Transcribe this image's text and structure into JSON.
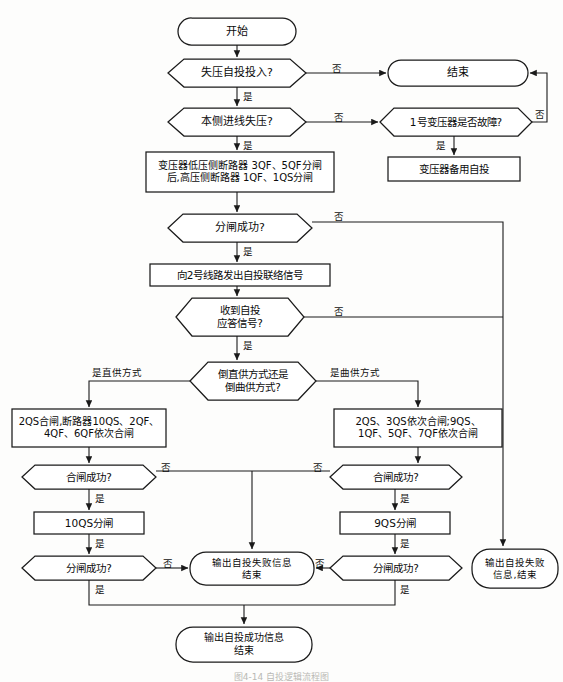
{
  "diagram": {
    "title_caption": "图4-14   自投逻辑流程图",
    "language": "zh-CN",
    "stroke_color": "#1a1a1a",
    "fill_color": "#ffffff",
    "background_color": "#fdfdfc",
    "yes_label": "是",
    "no_label": "否"
  },
  "nodes": {
    "start": {
      "label": "开始",
      "shape": "terminator"
    },
    "d_voltage_loss_enabled": {
      "label": "失压自投投入?",
      "shape": "decision"
    },
    "end_top": {
      "label": "结束",
      "shape": "terminator"
    },
    "d_local_line_loss": {
      "label": "本侧进线失压?",
      "shape": "decision"
    },
    "d_transformer_fault": {
      "label": "1号变压器是否故障?",
      "shape": "decision"
    },
    "transformer_standby": {
      "label": "变压器备用自投",
      "shape": "process"
    },
    "open_breakers": {
      "label_line1": "变压器低压侧断路器 3QF、5QF分闸",
      "label_line2": "后,高压侧断路器 1QF、1QS分闸",
      "shape": "process"
    },
    "d_open_success": {
      "label": "分闸成功?",
      "shape": "decision"
    },
    "send_signal": {
      "label": "向2号线路发出自投联络信号",
      "shape": "process"
    },
    "d_reply_signal": {
      "label_line1": "收到自投",
      "label_line2": "应答信号?",
      "shape": "decision"
    },
    "d_supply_mode": {
      "label_line1": "倒直供方式还是",
      "label_line2": "倒曲供方式?",
      "shape": "decision"
    },
    "left_close": {
      "label_line1": "2QS合闸,断路器10QS、2QF、",
      "label_line2": "4QF、6QF依次合闸",
      "shape": "process"
    },
    "right_close": {
      "label_line1": "2QS、3QS依次合闸;9QS、",
      "label_line2": "1QF、5QF、7QF依次合闸",
      "shape": "process"
    },
    "d_left_close_success": {
      "label": "合闸成功?",
      "shape": "decision"
    },
    "d_right_close_success": {
      "label": "合闸成功?",
      "shape": "decision"
    },
    "left_open_10qs": {
      "label": "10QS分闸",
      "shape": "process"
    },
    "right_open_9qs": {
      "label": "9QS分闸",
      "shape": "process"
    },
    "d_left_open_success": {
      "label": "分闸成功?",
      "shape": "decision"
    },
    "d_right_open_success": {
      "label": "分闸成功?",
      "shape": "decision"
    },
    "fail_center": {
      "label_line1": "输出自投失败信息",
      "label_line2": "结束",
      "shape": "terminator"
    },
    "fail_right": {
      "label_line1": "输出自投失败",
      "label_line2": "信息,结束",
      "shape": "terminator"
    },
    "success_end": {
      "label_line1": "输出自投成功信息",
      "label_line2": "结束",
      "shape": "terminator"
    }
  },
  "edge_labels": {
    "e1_no": "否",
    "e1_yes": "是",
    "e2_no": "否",
    "e2_yes": "是",
    "e3_no": "否",
    "e3_yes": "是",
    "e4_no": "否",
    "e4_yes": "是",
    "e5_no": "否",
    "e5_yes": "是",
    "e6_left_mode": "是直供方式",
    "e6_right_mode": "是曲供方式",
    "e7_left_no": "否",
    "e7_left_yes": "是",
    "e7_right_no": "否",
    "e7_right_yes": "是",
    "e8_left_yes": "是",
    "e8_right_yes": "是",
    "e9_left_no": "否",
    "e9_left_yes": "是",
    "e9_right_no": "否",
    "e9_right_yes": "是"
  }
}
